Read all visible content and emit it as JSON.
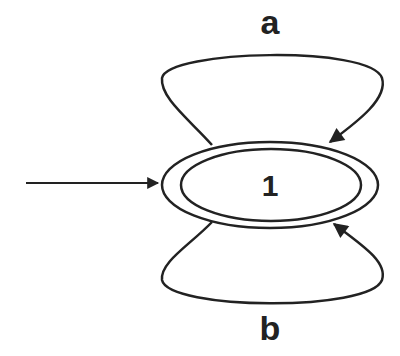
{
  "diagram": {
    "type": "finite-automaton",
    "states": [
      {
        "id": "1",
        "label": "1",
        "initial": true,
        "accepting": true
      }
    ],
    "transitions": [
      {
        "from": "1",
        "to": "1",
        "symbol": "a",
        "position": "top"
      },
      {
        "from": "1",
        "to": "1",
        "symbol": "b",
        "position": "bottom"
      }
    ],
    "labels": {
      "state_1": "1",
      "top_loop": "a",
      "bottom_loop": "b"
    },
    "colors": {
      "stroke": "#222222",
      "background": "#ffffff"
    }
  }
}
